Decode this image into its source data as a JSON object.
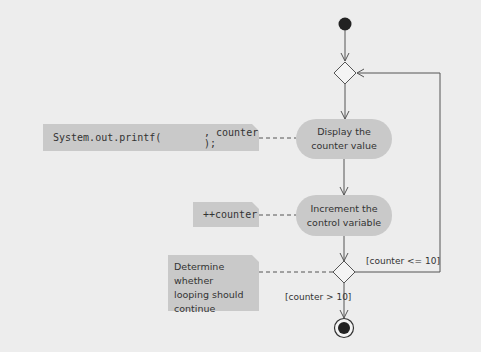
{
  "diagram": {
    "type": "uml-activity-diagram",
    "nodes": {
      "initial": {
        "label": "initial-node"
      },
      "merge": {
        "label": "merge-node"
      },
      "activity_display": {
        "label": "Display the counter value",
        "line1": "Display the",
        "line2": "counter value"
      },
      "activity_increment": {
        "label": "Increment the control variable",
        "line1": "Increment the",
        "line2": "control variable"
      },
      "decision": {
        "label": "decision-node"
      },
      "final": {
        "label": "final-node"
      }
    },
    "notes": {
      "printf": {
        "prefix": "System.out.printf(",
        "suffix": ", counter );"
      },
      "increment": {
        "text": "++counter"
      },
      "decision": {
        "line1": "Determine whether",
        "line2": "looping should",
        "line3": "continue"
      }
    },
    "guards": {
      "loop": "[counter <= 10]",
      "exit": "[counter > 10]"
    },
    "colors": {
      "background": "#ededed",
      "fill": "#c9c9c9",
      "stroke": "#555555",
      "node": "#222222"
    }
  }
}
